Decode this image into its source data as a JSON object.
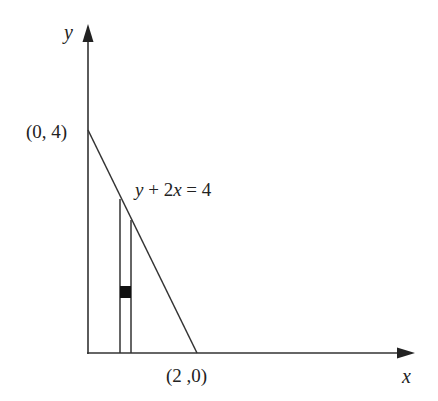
{
  "diagram": {
    "axes": {
      "x_label": "x",
      "y_label": "y"
    },
    "points": {
      "y_intercept": "(0, 4)",
      "x_intercept": "(2 ,0)"
    },
    "equation": {
      "y": "y",
      "plus": " + 2",
      "x": "x",
      "rest": " = 4"
    },
    "elements": [
      {
        "type": "line",
        "description": "boundary line y + 2x = 4 from (0,4) to (2,0)"
      },
      {
        "type": "strip",
        "description": "thin vertical rectangular strip under the line"
      },
      {
        "type": "element",
        "description": "small filled black square inside the strip"
      }
    ],
    "colors": {
      "stroke": "#333333",
      "fill_square": "#111111"
    }
  }
}
